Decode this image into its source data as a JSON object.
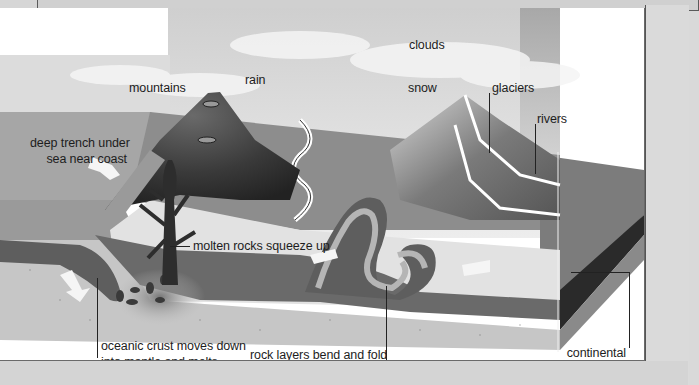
{
  "diagram": {
    "type": "geology cross-section",
    "labels": {
      "clouds": "clouds",
      "mountains": "mountains",
      "rain": "rain",
      "snow": "snow",
      "glaciers": "glaciers",
      "rivers": "rivers",
      "trench_line1": "deep trench under",
      "trench_line2": "sea near coast",
      "molten": "molten rocks squeeze  up",
      "oceanic_line1": "oceanic crust moves down",
      "oceanic_line2": "into mantle and melts",
      "rock_layers": "rock layers bend and fold",
      "continental_line1": "continental",
      "continental_line2": "crust"
    },
    "colors": {
      "sky": "#e4e4e4",
      "sea": "#a9a9a9",
      "land": "#8f8f8f",
      "volcano": "#3a3a3a",
      "crust_band": "#6d6d6d",
      "fold_light": "#b5b5b5",
      "mantle": "#c8c8c8",
      "dark_layer": "#2a2a2a",
      "arrow": "#f4f4f4"
    }
  }
}
